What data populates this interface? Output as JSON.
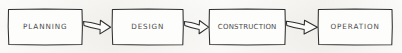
{
  "diagram": {
    "title": "Project Lifecycle Phase Flow",
    "type": "flowchart",
    "orientation": "left-to-right",
    "style": "hand-drawn-sketch",
    "background_color": "#f2f1ed",
    "stroke_color": "#2e2e2e",
    "text_color": "#4a4a4a",
    "box_fill": "#fdfdfc",
    "nodes": [
      {
        "id": "planning",
        "label": "PLANNING",
        "x": 8,
        "y": 9,
        "width": 74,
        "height": 36,
        "font_size": 7.2,
        "letter_spacing": 0.9
      },
      {
        "id": "design",
        "label": "DESIGN",
        "x": 112,
        "y": 9,
        "width": 71,
        "height": 36,
        "font_size": 7.2,
        "letter_spacing": 0.9
      },
      {
        "id": "construction",
        "label": "CONSTRUCTION",
        "x": 209,
        "y": 9,
        "width": 76,
        "height": 36,
        "font_size": 7.0,
        "letter_spacing": 0.2
      },
      {
        "id": "operation",
        "label": "OPERATION",
        "x": 318,
        "y": 9,
        "width": 74,
        "height": 36,
        "font_size": 7.2,
        "letter_spacing": 0.9
      }
    ],
    "connectors": [
      {
        "id": "planning-to-design",
        "from": "planning",
        "to": "design",
        "shape": "block-arrow",
        "x_start": 83,
        "x_end": 111
      },
      {
        "id": "design-to-construction",
        "from": "design",
        "to": "construction",
        "shape": "block-arrow",
        "x_start": 184,
        "x_end": 208
      },
      {
        "id": "construction-to-operation",
        "from": "construction",
        "to": "operation",
        "shape": "block-arrow",
        "x_start": 286,
        "x_end": 317
      }
    ]
  }
}
